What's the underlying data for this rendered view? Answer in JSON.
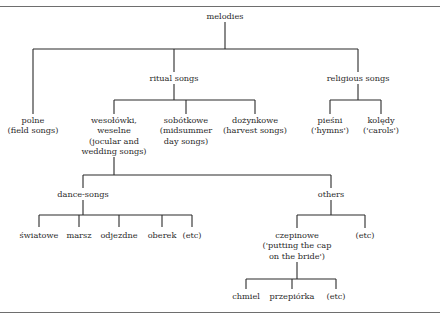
{
  "diagram": {
    "type": "tree",
    "title": "melodies",
    "nodes": [
      {
        "id": "melodies",
        "lines": [
          "melodies"
        ],
        "x": 225,
        "y": 11
      },
      {
        "id": "ritual",
        "lines": [
          "ritual songs"
        ],
        "x": 174,
        "y": 73
      },
      {
        "id": "religious",
        "lines": [
          "religious songs"
        ],
        "x": 358,
        "y": 73
      },
      {
        "id": "polne",
        "lines": [
          "polne",
          "(field songs)"
        ],
        "x": 33,
        "y": 115
      },
      {
        "id": "wesolowki",
        "lines": [
          "wesołówki,",
          "weselne",
          "(jocular and",
          "wedding songs)"
        ],
        "x": 114,
        "y": 115
      },
      {
        "id": "sobotkowe",
        "lines": [
          "sobótkowe",
          "(midsummer",
          "day songs)"
        ],
        "x": 186,
        "y": 115
      },
      {
        "id": "dozynkowe",
        "lines": [
          "dożynkowe",
          "(harvest songs)"
        ],
        "x": 255,
        "y": 115
      },
      {
        "id": "piesni",
        "lines": [
          "pieśni",
          "('hymns')"
        ],
        "x": 330,
        "y": 115
      },
      {
        "id": "koledy",
        "lines": [
          "kolędy",
          "('carols')"
        ],
        "x": 381,
        "y": 115
      },
      {
        "id": "dance",
        "lines": [
          "dance-songs"
        ],
        "x": 83,
        "y": 189
      },
      {
        "id": "others",
        "lines": [
          "others"
        ],
        "x": 331,
        "y": 189
      },
      {
        "id": "swiatowe",
        "lines": [
          "światowe"
        ],
        "x": 39,
        "y": 230
      },
      {
        "id": "marsz",
        "lines": [
          "marsz"
        ],
        "x": 79,
        "y": 230
      },
      {
        "id": "odjezdne",
        "lines": [
          "odjezdne"
        ],
        "x": 119,
        "y": 230
      },
      {
        "id": "oberek",
        "lines": [
          "oberek"
        ],
        "x": 162,
        "y": 230
      },
      {
        "id": "etc1",
        "lines": [
          "(etc)"
        ],
        "x": 192,
        "y": 230
      },
      {
        "id": "czepinowe",
        "lines": [
          "czepinowe",
          "('putting the cap",
          "on the bride')"
        ],
        "x": 297,
        "y": 230
      },
      {
        "id": "etc2",
        "lines": [
          "(etc)"
        ],
        "x": 365,
        "y": 230
      },
      {
        "id": "chmiel",
        "lines": [
          "chmiel"
        ],
        "x": 246,
        "y": 291
      },
      {
        "id": "przepiorka",
        "lines": [
          "przepiórka"
        ],
        "x": 292,
        "y": 291
      },
      {
        "id": "etc3",
        "lines": [
          "(etc)"
        ],
        "x": 336,
        "y": 291
      }
    ],
    "edges": [
      [
        "melodies",
        "polne"
      ],
      [
        "melodies",
        "ritual"
      ],
      [
        "melodies",
        "religious"
      ],
      [
        "ritual",
        "wesolowki"
      ],
      [
        "ritual",
        "sobotkowe"
      ],
      [
        "ritual",
        "dozynkowe"
      ],
      [
        "religious",
        "piesni"
      ],
      [
        "religious",
        "koledy"
      ],
      [
        "wesolowki",
        "dance"
      ],
      [
        "wesolowki",
        "others"
      ],
      [
        "dance",
        "swiatowe"
      ],
      [
        "dance",
        "marsz"
      ],
      [
        "dance",
        "odjezdne"
      ],
      [
        "dance",
        "oberek"
      ],
      [
        "dance",
        "etc1"
      ],
      [
        "others",
        "czepinowe"
      ],
      [
        "others",
        "etc2"
      ],
      [
        "czepinowe",
        "chmiel"
      ],
      [
        "czepinowe",
        "przepiorka"
      ],
      [
        "czepinowe",
        "etc3"
      ]
    ],
    "connectors": [
      {
        "parent": "melodies",
        "stem": [
          225,
          22,
          225,
          49
        ],
        "bar": [
          33,
          358,
          49
        ],
        "drops": [
          [
            33,
            49,
            114
          ],
          [
            174,
            49,
            72
          ],
          [
            358,
            49,
            72
          ]
        ]
      },
      {
        "parent": "ritual",
        "stem": [
          174,
          84,
          174,
          100
        ],
        "bar": [
          114,
          255,
          100
        ],
        "drops": [
          [
            114,
            100,
            114
          ],
          [
            186,
            100,
            114
          ],
          [
            255,
            100,
            114
          ]
        ]
      },
      {
        "parent": "religious",
        "stem": [
          358,
          84,
          358,
          100
        ],
        "bar": [
          330,
          381,
          100
        ],
        "drops": [
          [
            330,
            100,
            114
          ],
          [
            381,
            100,
            114
          ]
        ]
      },
      {
        "parent": "wesolowki",
        "stem": [
          114,
          157,
          114,
          175
        ],
        "bar": [
          83,
          331,
          175
        ],
        "drops": [
          [
            83,
            175,
            188
          ],
          [
            331,
            175,
            188
          ]
        ]
      },
      {
        "parent": "dance",
        "stem": [
          83,
          200,
          83,
          215
        ],
        "bar": [
          39,
          192,
          215
        ],
        "drops": [
          [
            39,
            215,
            227
          ],
          [
            79,
            215,
            227
          ],
          [
            119,
            215,
            227
          ],
          [
            162,
            215,
            227
          ],
          [
            192,
            215,
            227
          ]
        ]
      },
      {
        "parent": "others",
        "stem": [
          331,
          200,
          331,
          215
        ],
        "bar": [
          297,
          365,
          215
        ],
        "drops": [
          [
            297,
            215,
            228
          ],
          [
            365,
            215,
            228
          ]
        ]
      },
      {
        "parent": "czepinowe",
        "stem": [
          297,
          262,
          297,
          279
        ],
        "bar": [
          246,
          336,
          279
        ],
        "drops": [
          [
            246,
            279,
            289
          ],
          [
            292,
            279,
            289
          ],
          [
            336,
            279,
            289
          ]
        ]
      }
    ]
  }
}
